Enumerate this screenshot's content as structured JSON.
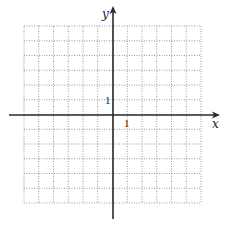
{
  "diagram": {
    "type": "coordinate-plane",
    "grid": {
      "columns": 12,
      "rows": 12,
      "x_range": [
        -6,
        6
      ],
      "y_range": [
        -6,
        6
      ],
      "line_style": "dotted",
      "line_color": "#9a9a9a"
    },
    "axes": {
      "color": "#2a2a2a",
      "x_label": "x",
      "y_label": "y",
      "x_tick_label": "1",
      "y_tick_label": "1"
    }
  }
}
